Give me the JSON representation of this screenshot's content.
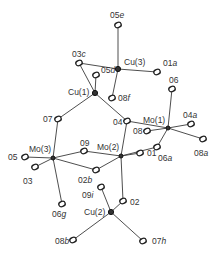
{
  "figure": {
    "header_fragment": "",
    "atoms": [
      {
        "id": "O5e",
        "label": "05",
        "suffix": "e",
        "x": 118,
        "y": 25,
        "type": "O",
        "lx": 110,
        "ly": 11
      },
      {
        "id": "Cu3",
        "label": "Cu(3)",
        "suffix": "",
        "x": 118,
        "y": 69,
        "type": "Cu",
        "lx": 124,
        "ly": 58
      },
      {
        "id": "O3c",
        "label": "03",
        "suffix": "c",
        "x": 79,
        "y": 63,
        "type": "O",
        "lx": 72,
        "ly": 50
      },
      {
        "id": "O1a",
        "label": "01",
        "suffix": "a",
        "x": 157,
        "y": 72,
        "type": "O",
        "lx": 163,
        "ly": 59
      },
      {
        "id": "O5d",
        "label": "05",
        "suffix": "d",
        "x": 96,
        "y": 75,
        "type": "O",
        "lx": 101,
        "ly": 66
      },
      {
        "id": "Cu1",
        "label": "Cu(1)",
        "suffix": "",
        "x": 95,
        "y": 93,
        "type": "Cu",
        "lx": 68,
        "ly": 88
      },
      {
        "id": "O6",
        "label": "06",
        "suffix": "",
        "x": 172,
        "y": 89,
        "type": "O",
        "lx": 169,
        "ly": 76
      },
      {
        "id": "O8f",
        "label": "08",
        "suffix": "f",
        "x": 112,
        "y": 98,
        "type": "O",
        "lx": 118,
        "ly": 94
      },
      {
        "id": "O4",
        "label": "04",
        "suffix": "",
        "x": 127,
        "y": 121,
        "type": "O",
        "lx": 113,
        "ly": 118
      },
      {
        "id": "Mo1",
        "label": "Mo(1)",
        "suffix": "",
        "x": 168,
        "y": 128,
        "type": "Mo",
        "lx": 143,
        "ly": 116
      },
      {
        "id": "O8",
        "label": "08",
        "suffix": "",
        "x": 147,
        "y": 131,
        "type": "O",
        "lx": 133,
        "ly": 127
      },
      {
        "id": "O4a",
        "label": "04",
        "suffix": "a",
        "x": 191,
        "y": 124,
        "type": "O",
        "lx": 183,
        "ly": 111
      },
      {
        "id": "O8a",
        "label": "08",
        "suffix": "a",
        "x": 203,
        "y": 139,
        "type": "O",
        "lx": 194,
        "ly": 149
      },
      {
        "id": "O7",
        "label": "07",
        "suffix": "",
        "x": 58,
        "y": 119,
        "type": "O",
        "lx": 43,
        "ly": 115
      },
      {
        "id": "Mo3",
        "label": "Mo(3)",
        "suffix": "",
        "x": 53,
        "y": 158,
        "type": "Mo",
        "lx": 29,
        "ly": 145
      },
      {
        "id": "O5",
        "label": "05",
        "suffix": "",
        "x": 25,
        "y": 157,
        "type": "O",
        "lx": 8,
        "ly": 153
      },
      {
        "id": "O3",
        "label": "03",
        "suffix": "",
        "x": 35,
        "y": 167,
        "type": "O",
        "lx": 23,
        "ly": 177
      },
      {
        "id": "O9",
        "label": "09",
        "suffix": "",
        "x": 84,
        "y": 151,
        "type": "O",
        "lx": 80,
        "ly": 139
      },
      {
        "id": "Mo2",
        "label": "Mo(2)",
        "suffix": "",
        "x": 121,
        "y": 156,
        "type": "Mo",
        "lx": 97,
        "ly": 143
      },
      {
        "id": "O1",
        "label": "01",
        "suffix": "",
        "x": 140,
        "y": 153,
        "type": "O",
        "lx": 147,
        "ly": 149
      },
      {
        "id": "O2b",
        "label": "02",
        "suffix": "b",
        "x": 96,
        "y": 170,
        "type": "O",
        "lx": 78,
        "ly": 176
      },
      {
        "id": "O6a",
        "label": "06",
        "suffix": "a",
        "x": 157,
        "y": 147,
        "type": "O",
        "lx": 158,
        "ly": 154
      },
      {
        "id": "O6g",
        "label": "06",
        "suffix": "g",
        "x": 62,
        "y": 204,
        "type": "O",
        "lx": 52,
        "ly": 210
      },
      {
        "id": "O9i",
        "label": "09",
        "suffix": "i",
        "x": 101,
        "y": 187,
        "type": "O",
        "lx": 82,
        "ly": 191
      },
      {
        "id": "O2",
        "label": "02",
        "suffix": "",
        "x": 123,
        "y": 201,
        "type": "O",
        "lx": 130,
        "ly": 198
      },
      {
        "id": "Cu2",
        "label": "Cu(2)",
        "suffix": "",
        "x": 111,
        "y": 212,
        "type": "Cu",
        "lx": 84,
        "ly": 208
      },
      {
        "id": "O8b",
        "label": "08",
        "suffix": "b",
        "x": 73,
        "y": 240,
        "type": "O",
        "lx": 55,
        "ly": 237
      },
      {
        "id": "O7h",
        "label": "07",
        "suffix": "h",
        "x": 143,
        "y": 241,
        "type": "O",
        "lx": 152,
        "ly": 237
      }
    ],
    "bonds": [
      [
        "Cu3",
        "O5e"
      ],
      [
        "Cu3",
        "O3c"
      ],
      [
        "Cu3",
        "O1a"
      ],
      [
        "Cu3",
        "O8f"
      ],
      [
        "Cu1",
        "O3c"
      ],
      [
        "Cu1",
        "O5d"
      ],
      [
        "Cu1",
        "O7"
      ],
      [
        "Cu1",
        "O4"
      ],
      [
        "Mo1",
        "O6"
      ],
      [
        "Mo1",
        "O4"
      ],
      [
        "Mo1",
        "O8"
      ],
      [
        "Mo1",
        "O4a"
      ],
      [
        "Mo1",
        "O8a"
      ],
      [
        "Mo1",
        "O6a"
      ],
      [
        "Mo3",
        "O7"
      ],
      [
        "Mo3",
        "O5"
      ],
      [
        "Mo3",
        "O3"
      ],
      [
        "Mo3",
        "O9"
      ],
      [
        "Mo3",
        "O2b"
      ],
      [
        "Mo3",
        "O6g"
      ],
      [
        "Mo2",
        "O9"
      ],
      [
        "Mo2",
        "O4"
      ],
      [
        "Mo2",
        "O1"
      ],
      [
        "Mo2",
        "O2b"
      ],
      [
        "Mo2",
        "O6a"
      ],
      [
        "Mo2",
        "O2"
      ],
      [
        "Cu2",
        "O9i"
      ],
      [
        "Cu2",
        "O2"
      ],
      [
        "Cu2",
        "O8b"
      ],
      [
        "Cu2",
        "O7h"
      ]
    ]
  }
}
